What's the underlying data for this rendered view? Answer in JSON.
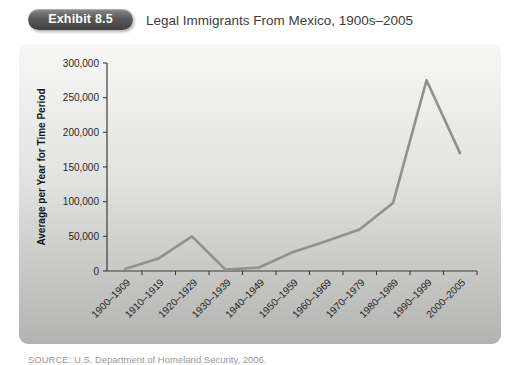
{
  "header": {
    "badge": "Exhibit 8.5",
    "title": "Legal Immigrants From Mexico, 1900s–2005"
  },
  "footer": {
    "source": "SOURCE: U.S. Department of Homeland Security, 2006."
  },
  "colors": {
    "badge_dark": "#4a4a4a",
    "panel_top": "#f7f7f5",
    "panel_bottom": "#b3b3b1",
    "line": "#90908e",
    "axis": "#3c3c3c"
  },
  "chart_data": {
    "type": "line",
    "title": "Legal Immigrants From Mexico, 1900s–2005",
    "ylabel": "Average per Year for Time Period",
    "xlabel": "",
    "categories": [
      "1900–1909",
      "1910–1919",
      "1920–1929",
      "1930–1939",
      "1940–1949",
      "1950–1959",
      "1960–1969",
      "1970–1979",
      "1980–1989",
      "1990–1999",
      "2000–2005"
    ],
    "values": [
      3000,
      18000,
      50000,
      2000,
      5000,
      27000,
      43000,
      60000,
      98000,
      275000,
      170000
    ],
    "ylim": [
      0,
      300000
    ],
    "y_ticks": [
      0,
      50000,
      100000,
      150000,
      200000,
      250000,
      300000
    ],
    "y_tick_labels": [
      "0",
      "50,000",
      "100,000",
      "150,000",
      "200,000",
      "250,000",
      "300,000"
    ],
    "grid": false,
    "legend": false,
    "line_color": "#90908e",
    "axis_color": "#3c3c3c"
  }
}
